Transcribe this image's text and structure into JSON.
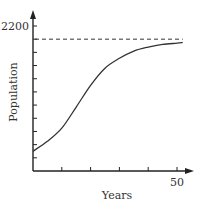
{
  "chart_data": {
    "type": "line",
    "title": "",
    "xlabel": "Years",
    "ylabel": "Population",
    "xlim": [
      0,
      55
    ],
    "ylim": [
      0,
      2200
    ],
    "x_ticks": [
      10,
      20,
      30,
      40,
      50
    ],
    "x_tick_labels": [
      "",
      "",
      "",
      "",
      "50"
    ],
    "y_ticks": [
      200,
      400,
      600,
      800,
      1000,
      1200,
      1400,
      1600,
      1800,
      2000,
      2200
    ],
    "y_tick_labels": [
      "",
      "",
      "",
      "",
      "",
      "",
      "",
      "",
      "",
      "",
      "2200"
    ],
    "grid": false,
    "legend": null,
    "series": [
      {
        "name": "Population",
        "style": "solid",
        "x": [
          0,
          5,
          10,
          15,
          20,
          25,
          30,
          35,
          40,
          45,
          50,
          52
        ],
        "y": [
          300,
          450,
          650,
          970,
          1300,
          1560,
          1710,
          1820,
          1880,
          1920,
          1940,
          1950
        ]
      }
    ],
    "reference_lines": [
      {
        "name": "carrying-capacity",
        "type": "horizontal",
        "y": 2000,
        "style": "dashed",
        "x_range": [
          0,
          52
        ]
      }
    ]
  },
  "labels": {
    "x_axis": "Years",
    "y_axis": "Population",
    "y_top_tick": "2200",
    "x_last_tick": "50"
  },
  "colors": {
    "axis": "#222222",
    "curve": "#333333",
    "dashed": "#333333",
    "text": "#333333"
  }
}
